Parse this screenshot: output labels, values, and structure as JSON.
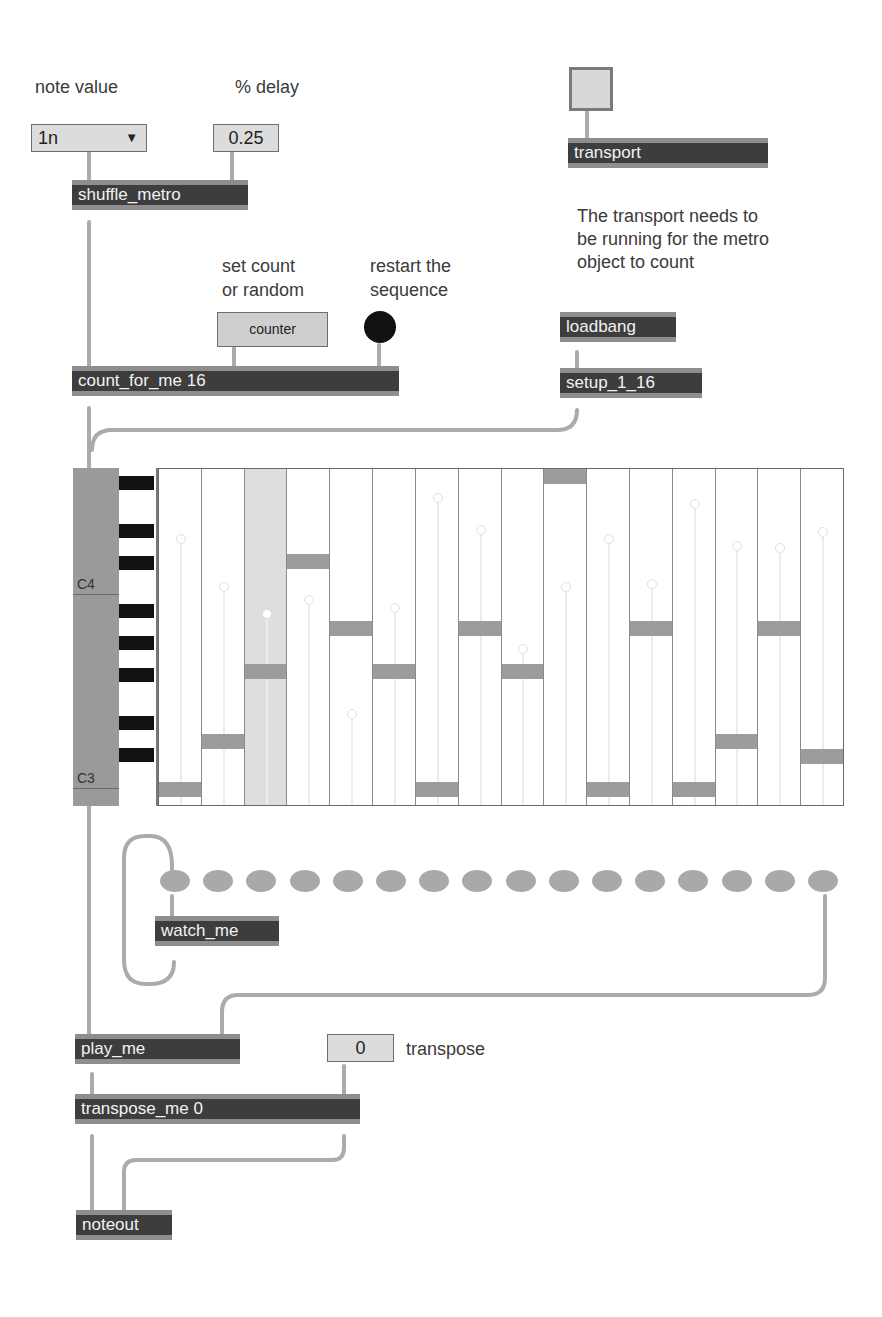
{
  "labels": {
    "note_value": "note value",
    "percent_delay": "% delay",
    "set_count": "set count\nor random",
    "restart": "restart the\nsequence",
    "transport_note": "The transport needs to\nbe running for the metro\nobject to count",
    "transpose": "transpose"
  },
  "controls": {
    "note_value_menu": {
      "value": "1n",
      "arrow": "▼"
    },
    "delay_number": {
      "value": "0.25"
    },
    "counter_message": {
      "label": "counter"
    },
    "transpose_number": {
      "value": "0"
    }
  },
  "objects": {
    "shuffle_metro": "shuffle_metro",
    "count_for_me": "count_for_me 16",
    "transport": "transport",
    "loadbang": "loadbang",
    "setup": "setup_1_16",
    "watch_me": "watch_me",
    "play_me": "play_me",
    "transpose_me": "transpose_me 0",
    "noteout": "noteout"
  },
  "piano_roll": {
    "labels": {
      "c4": "C4",
      "c3": "C3"
    },
    "steps": 16,
    "active_step": 3,
    "bar_tops": [
      313,
      265,
      195,
      85,
      152,
      195,
      313,
      152,
      195,
      0,
      313,
      152,
      313,
      265,
      152,
      280
    ],
    "ghost_knob_tops": [
      65,
      113,
      140,
      126,
      240,
      134,
      24,
      56,
      175,
      113,
      65,
      110,
      30,
      72,
      74,
      58
    ]
  },
  "leds": {
    "count": 16,
    "color": "#a9a9a9"
  },
  "colors": {
    "object_bg": "#3d3d3d",
    "object_border": "#8e8e8e",
    "cord": "#a8a8a8",
    "numbox_bg": "#dcdcdc",
    "bar": "#9c9c9c"
  }
}
